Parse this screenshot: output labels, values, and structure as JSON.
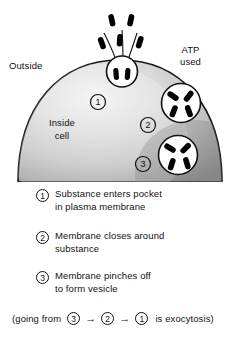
{
  "figure": {
    "labels": {
      "outside": "Outside",
      "atp_used": "ATP\nused",
      "inside_cell": "Inside\ncell"
    },
    "markers": {
      "one": "1",
      "two": "2",
      "three": "3"
    },
    "colors": {
      "cytoplasm_light": "#f0f0f0",
      "cytoplasm_mid": "#c8c8c8",
      "cytoplasm_dark": "#8f8f8f",
      "outline": "#111111",
      "particle": "#000000",
      "background": "#ffffff"
    }
  },
  "legend": {
    "steps": [
      {
        "number": "1",
        "text": "Substance enters pocket\nin plasma membrane"
      },
      {
        "number": "2",
        "text": "Membrane closes around\nsubstance"
      },
      {
        "number": "3",
        "text": "Membrane pinches off\nto form vesicle"
      }
    ]
  },
  "footnote": {
    "lead": "(going from",
    "first": "3",
    "arrow1": "→",
    "second": "2",
    "arrow2": "→",
    "third": "1",
    "tail": "is exocytosis)"
  }
}
